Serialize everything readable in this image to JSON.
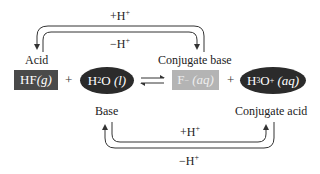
{
  "diagram": {
    "top_pair": {
      "forward_label": "+H",
      "forward_sup": "+",
      "reverse_label": "−H",
      "reverse_sup": "+",
      "left_label": "Acid",
      "right_label": "Conjugate base"
    },
    "bottom_pair": {
      "forward_label": "+H",
      "forward_sup": "+",
      "reverse_label": "−H",
      "reverse_sup": "+",
      "left_label": "Base",
      "right_label": "Conjugate acid"
    },
    "equation": {
      "species": [
        {
          "formula": "HF",
          "state": "(g)",
          "shape": "rect",
          "color": "#4a4a4a"
        },
        {
          "formula_a": "H",
          "formula_sub": "2",
          "formula_b": "O",
          "state": "(l)",
          "shape": "ellipse",
          "color": "#2b2b2b"
        },
        {
          "formula": "F",
          "formula_sup": "−",
          "state": "(aq)",
          "shape": "rect",
          "color": "#b4b4b4"
        },
        {
          "formula_a": "H",
          "formula_sub": "3",
          "formula_b": "O",
          "formula_sup": "+",
          "state": "(aq)",
          "shape": "ellipse",
          "color": "#2b2b2b"
        }
      ],
      "plus": "+",
      "equilibrium": "⇌"
    }
  }
}
